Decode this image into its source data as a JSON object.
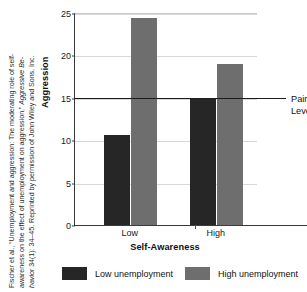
{
  "caption": {
    "line1_a": "Fischer et al., “Unemployment and aggression: The moderating role of self-",
    "line2_a": "awareness on the effect of unemployment on aggression,” ",
    "line2_i": "Aggressive Be-",
    "line3_i": "havior",
    "line3_a": " 34(1): 34–45.  Reprinted by permission of John Wiley and Sons, Inc."
  },
  "chart_data": {
    "type": "bar",
    "title": "",
    "xlabel": "Self-Awareness",
    "ylabel": "Aggression",
    "categories": [
      "Low",
      "High"
    ],
    "series": [
      {
        "name": "Low unemployment",
        "values": [
          10.6,
          15.0
        ],
        "color": "#262626"
      },
      {
        "name": "High unemployment",
        "values": [
          24.4,
          19.0
        ],
        "color": "#6e6e6e"
      }
    ],
    "ylim": [
      0,
      25
    ],
    "yticks": [
      0,
      5,
      10,
      15,
      20,
      25
    ],
    "ytick_labels": [
      "0",
      "5",
      "10",
      "15",
      "20",
      "25"
    ],
    "grid": true,
    "legend_position": "bottom",
    "annotations": [
      {
        "name": "pain-level",
        "label_line1": "Pain",
        "label_line2": "Level",
        "type": "hline",
        "value": 15
      }
    ]
  },
  "legend": {
    "items": [
      {
        "label": "Low unemployment",
        "color": "#262626"
      },
      {
        "label": "High unemployment",
        "color": "#6e6e6e"
      }
    ]
  }
}
